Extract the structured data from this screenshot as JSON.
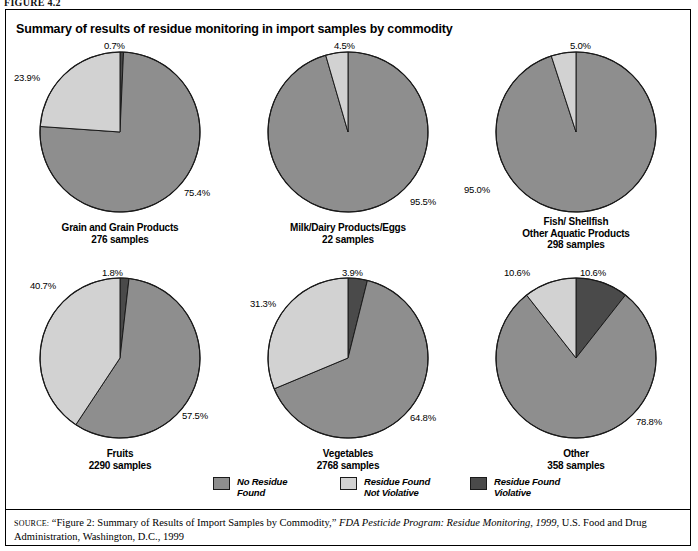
{
  "figure_label": "FIGURE 4.2",
  "title": "Summary of results of residue monitoring in import samples by commodity",
  "legend": {
    "items": [
      {
        "label": "No Residue\nFound",
        "color": "#8e8e8e",
        "key": "no_residue"
      },
      {
        "label": "Residue Found\nNot Violative",
        "color": "#d2d2d2",
        "key": "not_violative"
      },
      {
        "label": "Residue Found\nViolative",
        "color": "#4a4a4a",
        "key": "violative"
      }
    ]
  },
  "source": {
    "lead": "SOURCE:",
    "text_before_italic": " “Figure 2: Summary of Results of Import Samples by Commodity,” ",
    "italic": "FDA Pesticide Program: Residue Monitoring, 1999",
    "text_after_italic": ", U.S. Food and Drug Administration, Washington, D.C., 1999"
  },
  "chart_data": {
    "type": "pie",
    "title": "Summary of results of residue monitoring in import samples by commodity",
    "units": "percent of samples",
    "legend_position": "bottom",
    "series_names": [
      "No Residue Found",
      "Residue Found Not Violative",
      "Residue Found Violative"
    ],
    "series_colors": [
      "#8e8e8e",
      "#d2d2d2",
      "#4a4a4a"
    ],
    "slice_order_clockwise_from_12": [
      "violative",
      "no_residue",
      "not_violative"
    ],
    "charts": [
      {
        "name": "Grain and Grain Products",
        "caption_line1": "Grain and Grain Products",
        "caption_line2": "276 samples",
        "samples": 276,
        "values": {
          "no_residue": 75.4,
          "not_violative": 23.9,
          "violative": 0.7
        },
        "labels": [
          {
            "text": "0.7%",
            "key": "violative",
            "x": 98,
            "y": -4
          },
          {
            "text": "23.9%",
            "key": "not_violative",
            "x": 8,
            "y": 28
          },
          {
            "text": "75.4%",
            "key": "no_residue",
            "x": 178,
            "y": 143
          }
        ]
      },
      {
        "name": "Milk/Dairy Products/Eggs",
        "caption_line1": "Milk/Dairy Products/Eggs",
        "caption_line2": "22 samples",
        "samples": 22,
        "values": {
          "no_residue": 95.5,
          "not_violative": 4.5,
          "violative": 0.0
        },
        "labels": [
          {
            "text": "4.5%",
            "key": "not_violative",
            "x": 100,
            "y": -4
          },
          {
            "text": "95.5%",
            "key": "no_residue",
            "x": 176,
            "y": 152
          }
        ]
      },
      {
        "name": "Fish/ Shellfish Other Aquatic Products",
        "caption_line1": "Fish/ Shellfish",
        "caption_line2": "Other Aquatic Products",
        "caption_line3": "298 samples",
        "samples": 298,
        "values": {
          "no_residue": 95.0,
          "not_violative": 5.0,
          "violative": 0.0
        },
        "labels": [
          {
            "text": "5.0%",
            "key": "not_violative",
            "x": 108,
            "y": -4
          },
          {
            "text": "95.0%",
            "key": "no_residue",
            "x": 2,
            "y": 140
          }
        ]
      },
      {
        "name": "Fruits",
        "caption_line1": "Fruits",
        "caption_line2": "2290 samples",
        "samples": 2290,
        "values": {
          "no_residue": 57.5,
          "not_violative": 40.7,
          "violative": 1.8
        },
        "labels": [
          {
            "text": "1.8%",
            "key": "violative",
            "x": 96,
            "y": -3
          },
          {
            "text": "40.7%",
            "key": "not_violative",
            "x": 24,
            "y": 10
          },
          {
            "text": "57.5%",
            "key": "no_residue",
            "x": 176,
            "y": 140
          }
        ]
      },
      {
        "name": "Vegetables",
        "caption_line1": "Vegetables",
        "caption_line2": "2768 samples",
        "samples": 2768,
        "values": {
          "no_residue": 64.8,
          "not_violative": 31.3,
          "violative": 3.9
        },
        "labels": [
          {
            "text": "3.9%",
            "key": "violative",
            "x": 108,
            "y": -3
          },
          {
            "text": "31.3%",
            "key": "not_violative",
            "x": 16,
            "y": 28
          },
          {
            "text": "64.8%",
            "key": "no_residue",
            "x": 176,
            "y": 142
          }
        ]
      },
      {
        "name": "Other",
        "caption_line1": "Other",
        "caption_line2": "358 samples",
        "samples": 358,
        "values": {
          "no_residue": 78.8,
          "not_violative": 10.6,
          "violative": 10.6
        },
        "labels": [
          {
            "text": "10.6%",
            "key": "violative",
            "x": 118,
            "y": -3
          },
          {
            "text": "10.6%",
            "key": "not_violative",
            "x": 42,
            "y": -3
          },
          {
            "text": "78.8%",
            "key": "no_residue",
            "x": 174,
            "y": 146
          }
        ]
      }
    ]
  }
}
